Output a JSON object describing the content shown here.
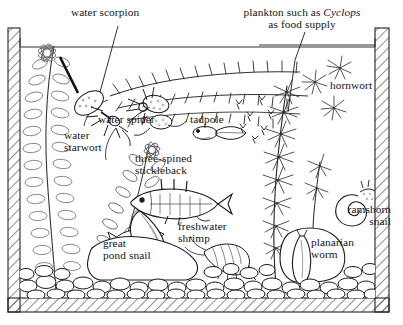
{
  "figure": {
    "type": "pen-and-ink biological illustration",
    "background_color": "#ffffff",
    "ink_color": "#141414"
  },
  "tank": {
    "name": "glass-walled aquarium tank",
    "wall_style": "diagonal hatching",
    "water_line_label": "water surface",
    "substrate_label": "gravel bed",
    "left_wall_x": 8,
    "right_wall_x": 375,
    "bottom_wall_y": 298,
    "water_line_y": 47
  },
  "labels": [
    {
      "id": "water-scorpion",
      "text": "water scorpion",
      "x": 71,
      "y": 8,
      "align": "left"
    },
    {
      "id": "plankton",
      "line1": "plankton such as ",
      "italic": "Cyclops",
      "line2": "as food supply",
      "x": 222,
      "y": 8,
      "align": "center"
    },
    {
      "id": "hornwort",
      "text": "hornwort",
      "x": 330,
      "y": 83,
      "align": "left"
    },
    {
      "id": "water-spider",
      "text": "water spider",
      "x": 99,
      "y": 117,
      "align": "left"
    },
    {
      "id": "tadpole",
      "text": "tadpole",
      "x": 190,
      "y": 117,
      "align": "left"
    },
    {
      "id": "water-starwort",
      "line1": "water",
      "line2": "starwort",
      "x": 64,
      "y": 133,
      "align": "left"
    },
    {
      "id": "three-spined-stickleback",
      "line1": "three-spined",
      "line2": "stickleback",
      "x": 135,
      "y": 155,
      "align": "left"
    },
    {
      "id": "ramshorn-snail",
      "line1": "ramshorn",
      "line2": "snail",
      "x": 327,
      "y": 207,
      "align": "left"
    },
    {
      "id": "freshwater-shrimp",
      "line1": "freshwater",
      "line2": "shrimp",
      "x": 178,
      "y": 224,
      "align": "left"
    },
    {
      "id": "great-pond-snail",
      "line1": "great",
      "line2": "pond snail",
      "x": 103,
      "y": 240,
      "align": "left"
    },
    {
      "id": "planarian-worm",
      "line1": "planarian",
      "line2": "worm",
      "x": 313,
      "y": 239,
      "align": "left"
    }
  ],
  "organisms": [
    {
      "name": "water scorpion",
      "kind": "insect"
    },
    {
      "name": "water spider",
      "kind": "arachnid"
    },
    {
      "name": "tadpole",
      "kind": "amphibian larva"
    },
    {
      "name": "three-spined stickleback",
      "kind": "fish"
    },
    {
      "name": "great pond snail",
      "kind": "mollusc"
    },
    {
      "name": "ramshorn snail",
      "kind": "mollusc"
    },
    {
      "name": "freshwater shrimp",
      "kind": "crustacean"
    },
    {
      "name": "planarian worm",
      "kind": "flatworm"
    },
    {
      "name": "Cyclops plankton",
      "kind": "copepod"
    }
  ],
  "plants": [
    {
      "name": "water starwort",
      "position": "left"
    },
    {
      "name": "hornwort",
      "position": "right"
    }
  ]
}
